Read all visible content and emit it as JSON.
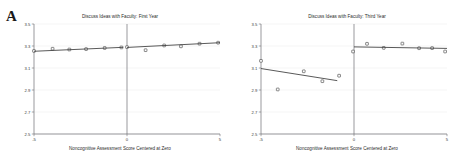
{
  "figure": {
    "panel_label": "A",
    "background": "#ffffff",
    "line_color": "#3b3b3b",
    "marker_edge_color": "#4a4a4a",
    "grid_color": "#ececed"
  },
  "chart_data": [
    {
      "type": "scatter",
      "id": "first-year",
      "title": "Discuss Ideas with Faculty: First Year",
      "xlabel": "Noncognitive Assessment Score Centered at Zero",
      "ylabel": "",
      "xlim": [
        -5,
        5
      ],
      "ylim": [
        2.5,
        3.5
      ],
      "xticks": [
        -5,
        0,
        5
      ],
      "xticklabels": [
        "-5",
        "0",
        "5"
      ],
      "yticks": [
        2.5,
        2.7,
        2.9,
        3.1,
        3.3,
        3.5
      ],
      "yticklabels": [
        "2.5",
        "2.7",
        "2.9",
        "3.1",
        "3.3",
        "3.5"
      ],
      "grid": true,
      "cutoff_x": 0,
      "legend": "none",
      "series": [
        {
          "name": "Binned means (left of cutoff)",
          "marker": "open-square",
          "x": [
            -5.0,
            -4.0,
            -3.1,
            -2.2,
            -1.2,
            -0.3
          ],
          "y": [
            3.255,
            3.275,
            3.268,
            3.272,
            3.282,
            3.287
          ]
        },
        {
          "name": "Binned means (right of cutoff)",
          "marker": "open-square",
          "x": [
            0.0,
            1.0,
            2.0,
            2.9,
            3.9,
            4.9
          ],
          "y": [
            3.29,
            3.262,
            3.305,
            3.297,
            3.321,
            3.33
          ]
        },
        {
          "name": "Local linear fit (left of cutoff)",
          "marker": "none",
          "fit": "line",
          "x": [
            -5.0,
            -0.2
          ],
          "y": [
            3.252,
            3.288
          ]
        },
        {
          "name": "Local linear fit (right of cutoff)",
          "marker": "none",
          "fit": "line",
          "x": [
            0.0,
            5.0
          ],
          "y": [
            3.287,
            3.33
          ]
        }
      ]
    },
    {
      "type": "scatter",
      "id": "third-year",
      "title": "Discuss Ideas with Faculty: Third Year",
      "xlabel": "Noncognitive Assessment Score Centered at Zero",
      "ylabel": "",
      "xlim": [
        -5,
        5
      ],
      "ylim": [
        2.5,
        3.5
      ],
      "xticks": [
        -5,
        0,
        5
      ],
      "xticklabels": [
        "-5",
        "0",
        "5"
      ],
      "yticks": [
        2.5,
        2.7,
        2.9,
        3.1,
        3.3,
        3.5
      ],
      "yticklabels": [
        "2.5",
        "2.7",
        "2.9",
        "3.1",
        "3.3",
        "3.5"
      ],
      "grid": true,
      "cutoff_x": 0,
      "legend": "none",
      "series": [
        {
          "name": "Binned means (left of cutoff)",
          "marker": "open-square",
          "x": [
            -5.0,
            -4.1,
            -2.7,
            -1.7,
            -0.8,
            -0.05
          ],
          "y": [
            3.165,
            2.905,
            3.07,
            2.98,
            3.03,
            3.25
          ]
        },
        {
          "name": "Binned means (right of cutoff)",
          "marker": "open-square",
          "x": [
            0.7,
            1.6,
            2.6,
            3.5,
            4.2,
            4.9
          ],
          "y": [
            3.32,
            3.283,
            3.322,
            3.28,
            3.281,
            3.25
          ]
        },
        {
          "name": "Local linear fit (left of cutoff)",
          "marker": "none",
          "fit": "line",
          "x": [
            -5.0,
            -0.9
          ],
          "y": [
            3.095,
            2.985
          ]
        },
        {
          "name": "Local linear fit (right of cutoff)",
          "marker": "none",
          "fit": "line",
          "x": [
            0.0,
            5.0
          ],
          "y": [
            3.292,
            3.278
          ]
        }
      ]
    }
  ]
}
